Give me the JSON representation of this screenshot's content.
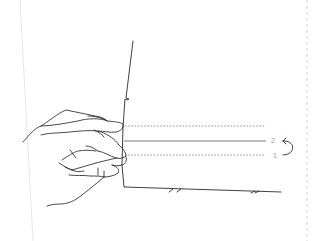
{
  "illustration": {
    "description": "Hand holding a sheet of paper between fingers; fold lines indicated",
    "colors": {
      "stroke": "#2b2b2b",
      "dashed_guide": "#8a8a8a",
      "faint_border": "#e2e2e2",
      "label": "#9a9a9a"
    },
    "fold_lines": [
      {
        "id": "top-dotted",
        "style": "dotted",
        "label": ""
      },
      {
        "id": "middle-solid",
        "style": "solid",
        "label": "2"
      },
      {
        "id": "bottom-dotted",
        "style": "dotted",
        "label": "1"
      }
    ],
    "labels": {
      "step_two": "2",
      "step_one": "1"
    },
    "icons": {
      "fold-arrow": "curved arrow from 1 to 2"
    }
  }
}
